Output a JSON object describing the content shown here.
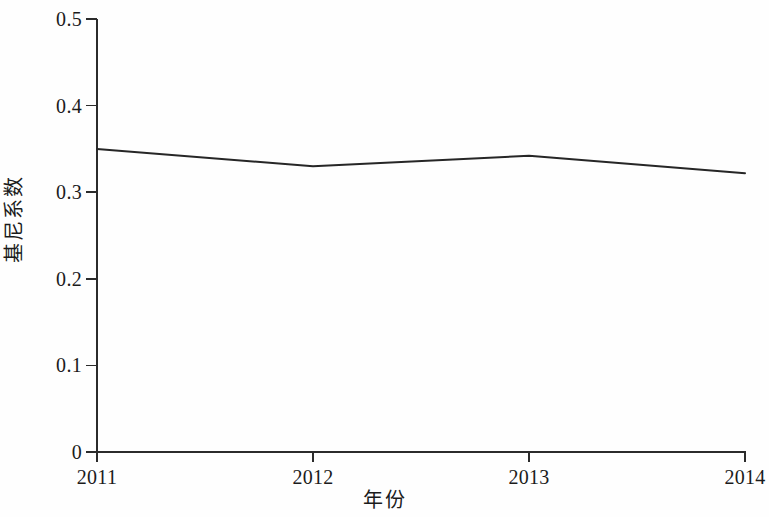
{
  "chart_data": {
    "type": "line",
    "title": "",
    "subtitle": "",
    "xlabel": "年份",
    "ylabel": "基尼系数",
    "categories": [
      "2011",
      "2012",
      "2013",
      "2014"
    ],
    "x": [
      2011,
      2012,
      2013,
      2014
    ],
    "values": [
      0.35,
      0.33,
      0.342,
      0.322
    ],
    "series": [
      {
        "name": "基尼系数",
        "values": [
          0.35,
          0.33,
          0.342,
          0.322
        ],
        "color": "#262626"
      }
    ],
    "xlim": [
      2011,
      2014
    ],
    "ylim": [
      0,
      0.5
    ],
    "y_ticks": [
      "0.5",
      "0.4",
      "0.3",
      "0.2",
      "0.1",
      "0"
    ],
    "y_tick_values": [
      0.5,
      0.4,
      0.3,
      0.2,
      0.1,
      0
    ],
    "x_ticks": [
      "2011",
      "2012",
      "2013",
      "2014"
    ],
    "grid": false,
    "legend": false,
    "legend_position": "none",
    "markers": false,
    "annotations": []
  },
  "axes": {
    "y_title": "基尼系数",
    "x_title": "年份",
    "y_labels": [
      "0.5",
      "0.4",
      "0.3",
      "0.2",
      "0.1",
      "0"
    ],
    "x_labels": [
      "2011",
      "2012",
      "2013",
      "2014"
    ]
  },
  "colors": {
    "line": "#262626",
    "axis": "#2b2b2b",
    "text": "#1b1b1b",
    "background": "#fefefe"
  }
}
